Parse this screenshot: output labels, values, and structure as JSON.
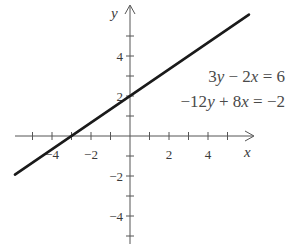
{
  "chart_data": {
    "type": "line",
    "title": "",
    "xlabel": "x",
    "ylabel": "y",
    "xlim": [
      -5.9,
      6.3
    ],
    "ylim": [
      -5.4,
      6.6
    ],
    "grid": false,
    "x_ticks": [
      -5,
      -4,
      -3,
      -2,
      -1,
      1,
      2,
      3,
      4,
      5
    ],
    "x_tick_labels": [
      {
        "value": -4,
        "label": "−4"
      },
      {
        "value": -2,
        "label": "−2"
      },
      {
        "value": 2,
        "label": "2"
      },
      {
        "value": 4,
        "label": "4"
      }
    ],
    "y_ticks": [
      -5,
      -4,
      -3,
      -2,
      -1,
      1,
      2,
      3,
      4,
      5
    ],
    "y_tick_labels": [
      {
        "value": 4,
        "label": "4"
      },
      {
        "value": 2,
        "label": "2"
      },
      {
        "value": -2,
        "label": "−2"
      },
      {
        "value": -4,
        "label": "−4"
      }
    ],
    "series": [
      {
        "name": "3y − 2x = 6",
        "equation": "y = (2/3)x + 2",
        "x": [
          -5.9,
          6.1
        ],
        "y": [
          -1.93,
          6.07
        ],
        "color": "#1a1a1a"
      }
    ],
    "annotations": [
      {
        "text_parts": [
          [
            "3",
            false
          ],
          [
            "y",
            true
          ],
          [
            " − 2",
            false
          ],
          [
            "x",
            true
          ],
          [
            " = 6",
            false
          ]
        ],
        "text": "3y − 2x = 6"
      },
      {
        "text_parts": [
          [
            "−12",
            false
          ],
          [
            "y",
            true
          ],
          [
            " + 8",
            false
          ],
          [
            "x",
            true
          ],
          [
            " = −2",
            false
          ]
        ],
        "text": "−12y + 8x = −2"
      }
    ],
    "colors": {
      "line": "#1a1a1a",
      "axis": "#555555",
      "text": "#3a3a3a"
    }
  }
}
